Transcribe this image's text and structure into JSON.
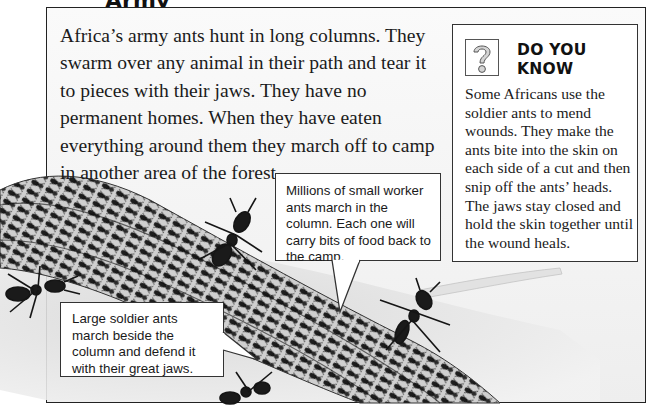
{
  "page": {
    "heading_fragment": "Army",
    "main_paragraph": "Africa’s army ants hunt in long columns. They swarm over any animal in their path and tear it to pieces with their jaws. They have no permanent homes. When they have eaten everything around them they march off to camp in another area of the forest."
  },
  "sidebar": {
    "icon": "question-mark-icon",
    "title_line1": "DO YOU",
    "title_line2": "KNOW",
    "body": "Some Africans use the soldier ants to mend wounds. They make the ants bite into the skin on each side of a cut and then snip off the ants’ heads. The jaws stay closed and hold the skin together until the wound heals."
  },
  "callouts": {
    "workers": "Millions of small worker ants march in the column. Each one will carry bits of food back to the camp.",
    "soldiers": "Large soldier ants march beside the column and defend it with their great jaws."
  },
  "illustration": {
    "subject": "army ants column illustration",
    "colors": {
      "ant": "#1e1e1e",
      "ground": "#e6e6e6",
      "border": "#222222"
    }
  }
}
